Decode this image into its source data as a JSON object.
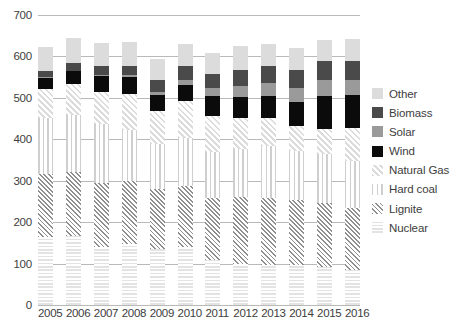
{
  "chart_data": {
    "type": "bar",
    "stacked": true,
    "title": "",
    "subtitle": "",
    "xlabel": "",
    "ylabel": "",
    "ylim": [
      0,
      700
    ],
    "yticks": [
      0,
      100,
      200,
      300,
      400,
      500,
      600,
      700
    ],
    "grid": true,
    "legend_position": "right",
    "categories": [
      "2005",
      "2006",
      "2007",
      "2008",
      "2009",
      "2010",
      "2011",
      "2012",
      "2013",
      "2014",
      "2015",
      "2016"
    ],
    "series": [
      {
        "name": "Nuclear",
        "key": "nuclear",
        "color": "#e3e3e3",
        "pattern": "horizontal-stripes",
        "values": [
          163,
          167,
          141,
          148,
          135,
          141,
          108,
          99,
          97,
          97,
          92,
          85
        ]
      },
      {
        "name": "Lignite",
        "key": "lignite",
        "color": "#8f8f8f",
        "pattern": "diagonal-hatch",
        "values": [
          154,
          154,
          154,
          151,
          146,
          146,
          150,
          161,
          161,
          156,
          155,
          150
        ]
      },
      {
        "name": "Hard coal",
        "key": "hardcoal",
        "color": "#cfcfcf",
        "pattern": "vertical-stripes",
        "values": [
          134,
          137,
          142,
          123,
          107,
          117,
          112,
          116,
          127,
          118,
          117,
          112
        ]
      },
      {
        "name": "Natural Gas",
        "key": "gas",
        "color": "#dcdcdc",
        "pattern": "diagonal-hatch-light",
        "values": [
          71,
          75,
          76,
          88,
          80,
          89,
          86,
          76,
          67,
          61,
          62,
          81
        ]
      },
      {
        "name": "Wind",
        "key": "wind",
        "color": "#0b0b0b",
        "pattern": "solid",
        "values": [
          27,
          31,
          40,
          41,
          39,
          38,
          49,
          51,
          52,
          57,
          79,
          78
        ]
      },
      {
        "name": "Solar",
        "key": "solar",
        "color": "#9a9a9a",
        "pattern": "solid",
        "values": [
          1,
          2,
          3,
          4,
          7,
          12,
          20,
          26,
          31,
          36,
          39,
          38
        ]
      },
      {
        "name": "Biomass",
        "key": "biomass",
        "color": "#4a4a4a",
        "pattern": "solid",
        "values": [
          14,
          19,
          22,
          22,
          29,
          34,
          33,
          39,
          41,
          43,
          46,
          45
        ]
      },
      {
        "name": "Other",
        "key": "other",
        "color": "#dcdcdc",
        "pattern": "solid",
        "values": [
          59,
          60,
          54,
          58,
          51,
          54,
          50,
          57,
          55,
          53,
          50,
          54
        ]
      }
    ],
    "totals": [
      623,
      645,
      632,
      635,
      594,
      631,
      608,
      625,
      631,
      621,
      640,
      643
    ],
    "units": "TWh"
  },
  "legend": {
    "items": [
      {
        "label": "Other"
      },
      {
        "label": "Biomass"
      },
      {
        "label": "Solar"
      },
      {
        "label": "Wind"
      },
      {
        "label": "Natural Gas"
      },
      {
        "label": "Hard coal"
      },
      {
        "label": "Lignite"
      },
      {
        "label": "Nuclear"
      }
    ]
  },
  "axes": {
    "y_tick_labels": [
      "700",
      "600",
      "500",
      "400",
      "300",
      "200",
      "100",
      "0"
    ],
    "x_tick_labels": [
      "2005",
      "2006",
      "2007",
      "2008",
      "2009",
      "2010",
      "2011",
      "2012",
      "2013",
      "2014",
      "2015",
      "2016"
    ]
  }
}
